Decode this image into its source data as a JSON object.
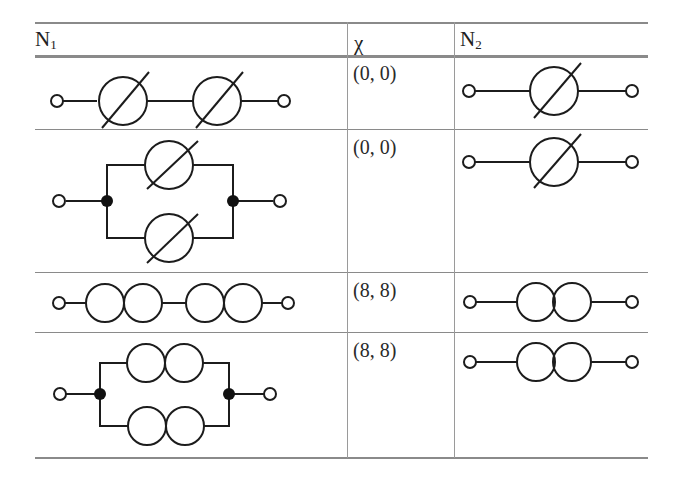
{
  "table": {
    "headers": {
      "n1": {
        "base": "N",
        "sub": "1"
      },
      "chi": "χ",
      "n2": {
        "base": "N",
        "sub": "2"
      }
    },
    "rows": [
      {
        "n1": {
          "diagram": "series",
          "element": "crossed-circle",
          "count": 2
        },
        "chi": "(0, 0)",
        "n2": {
          "diagram": "single",
          "element": "crossed-circle",
          "count": 1
        }
      },
      {
        "n1": {
          "diagram": "parallel",
          "element": "crossed-circle",
          "count": 2
        },
        "chi": "(0, 0)",
        "n2": {
          "diagram": "single",
          "element": "crossed-circle",
          "count": 1
        }
      },
      {
        "n1": {
          "diagram": "series",
          "element": "double-circle",
          "count": 2
        },
        "chi": "(8, 8)",
        "n2": {
          "diagram": "single",
          "element": "double-circle",
          "count": 1
        }
      },
      {
        "n1": {
          "diagram": "parallel",
          "element": "double-circle",
          "count": 2
        },
        "chi": "(8, 8)",
        "n2": {
          "diagram": "single",
          "element": "double-circle",
          "count": 1
        }
      }
    ]
  },
  "colors": {
    "rule": "#8a8a8a",
    "ink": "#1c1c1c"
  }
}
